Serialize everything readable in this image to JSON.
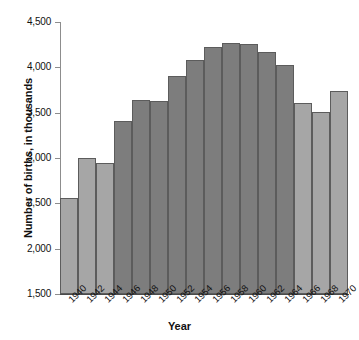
{
  "chart_data": {
    "type": "bar",
    "title": "",
    "xlabel": "Year",
    "ylabel": "Number of births, in thousands",
    "categories": [
      "1940",
      "1942",
      "1944",
      "1946",
      "1948",
      "1950",
      "1952",
      "1954",
      "1956",
      "1958",
      "1960",
      "1962",
      "1964",
      "1966",
      "1968",
      "1970"
    ],
    "values": [
      2560,
      3000,
      2950,
      3410,
      3640,
      3630,
      3910,
      4080,
      4220,
      4270,
      4260,
      4170,
      4030,
      3610,
      3510,
      3740
    ],
    "series": [
      {
        "name": "Number of births",
        "values": [
          2560,
          3000,
          2950,
          3410,
          3640,
          3630,
          3910,
          4080,
          4220,
          4270,
          4260,
          4170,
          4030,
          3610,
          3510,
          3740
        ],
        "shades": [
          "light",
          "light",
          "light",
          "dark",
          "dark",
          "dark",
          "dark",
          "dark",
          "dark",
          "dark",
          "dark",
          "dark",
          "dark",
          "light",
          "light",
          "light"
        ]
      }
    ],
    "ylim": [
      1500,
      4500
    ],
    "yticks": [
      1500,
      2000,
      2500,
      3000,
      3500,
      4000,
      4500
    ],
    "ytick_labels": [
      "1,500",
      "2,000",
      "2,500",
      "3,000",
      "3,500",
      "4,000",
      "4,500"
    ],
    "xtick_labels": [
      "1940",
      "1942",
      "1944",
      "1946",
      "1948",
      "1950",
      "1952",
      "1954",
      "1956",
      "1958",
      "1960",
      "1962",
      "1964",
      "1966",
      "1968",
      "1970"
    ],
    "grid": false,
    "legend": "none",
    "colors": {
      "bar_light": "#a6a6a6",
      "bar_dark": "#7d7d7d",
      "bar_border": "#5c5c5c",
      "axis": "#4a4a4a",
      "text": "#111111",
      "background": "#ffffff"
    }
  }
}
